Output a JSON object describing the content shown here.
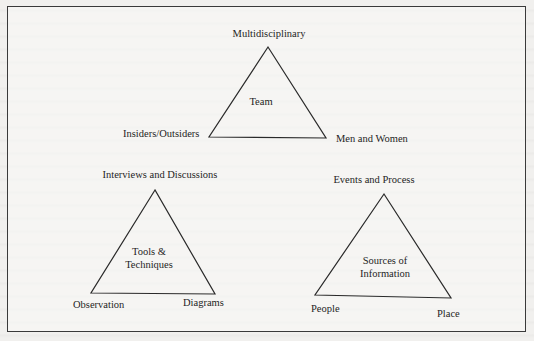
{
  "figure": {
    "frame_color": "#3a3a3a",
    "background": "#f1f0ee",
    "triangles": [
      {
        "id": "team",
        "center_label": "Team",
        "vertices": {
          "top": "Multidisciplinary",
          "bottom_left": "Insiders/Outsiders",
          "bottom_right": "Men and Women"
        }
      },
      {
        "id": "tools",
        "center_label_line1": "Tools &",
        "center_label_line2": "Techniques",
        "vertices": {
          "top": "Interviews and Discussions",
          "bottom_left": "Observation",
          "bottom_right": "Diagrams"
        }
      },
      {
        "id": "sources",
        "center_label_line1": "Sources of",
        "center_label_line2": "Information",
        "vertices": {
          "top": "Events and Process",
          "bottom_left": "People",
          "bottom_right": "Place"
        }
      }
    ]
  }
}
